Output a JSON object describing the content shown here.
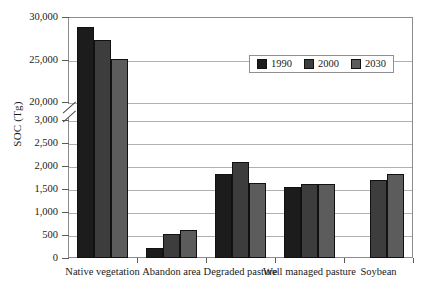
{
  "chart_data": {
    "type": "bar",
    "title": "",
    "xlabel": "",
    "ylabel": "SOC (Tg)",
    "categories": [
      "Native vegetation",
      "Abandon area",
      "Degraded pasture",
      "Well managed pasture",
      "Soybean"
    ],
    "series": [
      {
        "name": "1990",
        "color": "#1c1c1c",
        "values": [
          28800,
          210,
          1830,
          1540,
          null
        ]
      },
      {
        "name": "2000",
        "color": "#3d3d3d",
        "values": [
          27300,
          530,
          2080,
          1600,
          1700
        ]
      },
      {
        "name": "2030",
        "color": "#5c5c5c",
        "values": [
          25100,
          610,
          1640,
          1605,
          1830
        ]
      }
    ],
    "axis_break": {
      "present": true,
      "lower_max": 3000,
      "upper_min": 20000
    },
    "ylim_lower": [
      0,
      3000
    ],
    "ylim_upper": [
      20000,
      30000
    ],
    "ytick_labels": [
      "30,000",
      "25,000",
      "20,000",
      "3,000",
      "2,500",
      "2,000",
      "1,500",
      "1,000",
      "500",
      "0"
    ],
    "grid": true,
    "legend_position": "upper-right-inside"
  },
  "legend": {
    "entries": [
      {
        "label": "1990"
      },
      {
        "label": "2000"
      },
      {
        "label": "2030"
      }
    ]
  }
}
